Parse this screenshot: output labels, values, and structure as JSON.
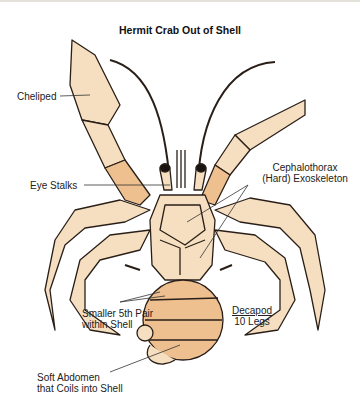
{
  "title": "Hermit Crab Out of Shell",
  "labels": {
    "cheliped": "Cheliped",
    "eye_stalks": "Eye Stalks",
    "cephalothorax_line1": "Cephalothorax",
    "cephalothorax_line2": "(Hard) Exoskeleton",
    "smaller_pair_line1": "Smaller 5th Pair",
    "smaller_pair_line2": "within Shell",
    "decapod": "Decapod",
    "legs": "10 Legs",
    "abdomen_line1": "Soft Abdomen",
    "abdomen_line2": "that Coils into Shell"
  },
  "colors": {
    "shell_light": "#f6dfc0",
    "shell_mid": "#eebf8f",
    "shell_dark": "#e2a67a",
    "outline": "#2a1f18",
    "background": "#ffffff"
  }
}
